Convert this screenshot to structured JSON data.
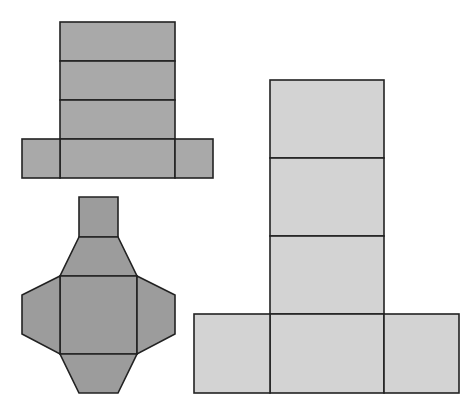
{
  "diagram": {
    "title": "",
    "stroke_color": "#222222",
    "background": "#ffffff",
    "nets": [
      {
        "id": "net-cuboid-small",
        "solid": "rectangular prism",
        "fill": "#a9a9a9",
        "faces": [
          {
            "type": "rect",
            "x": 60,
            "y": 22,
            "w": 115,
            "h": 39
          },
          {
            "type": "rect",
            "x": 60,
            "y": 61,
            "w": 115,
            "h": 39
          },
          {
            "type": "rect",
            "x": 60,
            "y": 100,
            "w": 115,
            "h": 39
          },
          {
            "type": "rect",
            "x": 60,
            "y": 139,
            "w": 115,
            "h": 39
          },
          {
            "type": "rect",
            "x": 22,
            "y": 139,
            "w": 38,
            "h": 39
          },
          {
            "type": "rect",
            "x": 175,
            "y": 139,
            "w": 38,
            "h": 39
          }
        ]
      },
      {
        "id": "net-frustum",
        "solid": "square frustum",
        "fill": "#9c9c9c",
        "faces": [
          {
            "type": "polygon",
            "points": "79,197 118,197 118,237 79,237"
          },
          {
            "type": "polygon",
            "points": "79,237 118,237 137,276 60,276"
          },
          {
            "type": "polygon",
            "points": "60,276 137,276 137,354 60,354"
          },
          {
            "type": "polygon",
            "points": "60,276 22,295 22,334 60,354"
          },
          {
            "type": "polygon",
            "points": "137,276 175,295 175,334 137,354"
          },
          {
            "type": "polygon",
            "points": "60,354 137,354 118,393 79,393"
          }
        ]
      },
      {
        "id": "net-cuboid-large",
        "solid": "rectangular prism",
        "fill": "#d3d3d3",
        "faces": [
          {
            "type": "rect",
            "x": 270,
            "y": 80,
            "w": 114,
            "h": 78
          },
          {
            "type": "rect",
            "x": 270,
            "y": 158,
            "w": 114,
            "h": 78
          },
          {
            "type": "rect",
            "x": 270,
            "y": 236,
            "w": 114,
            "h": 78
          },
          {
            "type": "rect",
            "x": 270,
            "y": 314,
            "w": 114,
            "h": 79
          },
          {
            "type": "rect",
            "x": 194,
            "y": 314,
            "w": 76,
            "h": 79
          },
          {
            "type": "rect",
            "x": 384,
            "y": 314,
            "w": 75,
            "h": 79
          }
        ]
      }
    ]
  }
}
